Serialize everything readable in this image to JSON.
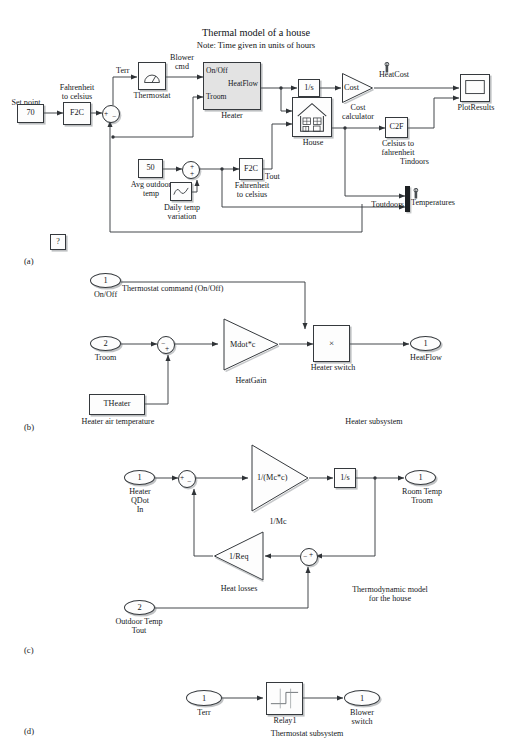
{
  "figure": {
    "title": "Thermal model of a house",
    "subtitle": "Note: Time given in units of hours",
    "panel_a": "(a)",
    "panel_b": "(b)",
    "panel_c": "(c)",
    "panel_d": "(d)"
  },
  "panel_a": {
    "caption_title": "Thermal model of a house",
    "caption_note": "Note: Time given in units of hours",
    "setpoint_label": "Set point",
    "setpoint_value": "70",
    "f2c_top_label": "Fahrenheit\nto celsius",
    "f2c_top_value": "F2C",
    "sum_plus": "+",
    "sum_minus": "−",
    "terr_label": "Terr",
    "thermostat_value": "",
    "thermostat_label": "Thermostat",
    "blower_cmd_label": "Blower\ncmd",
    "heater_port_in1": "On/Off",
    "heater_port_in2": "Troom",
    "heater_port_out": "HeatFlow",
    "heater_label": "Heater",
    "integrator_value": "1/s",
    "cost_gain_value": "Cost",
    "cost_label": "Cost\ncalculator",
    "heatcost_label": "HeatCost",
    "house_label": "House",
    "c2f_value": "C2F",
    "c2f_label": "Celsius to\nfahrenheit",
    "tindoors_label": "Tindoors",
    "toutdoors_label": "Toutdoors",
    "temperatures_label": "Temperatures",
    "plotresults_label": "PlotResults",
    "avg_outdoor_value": "50",
    "avg_outdoor_label": "Avg outdoor\ntemp",
    "daily_temp_label": "Daily temp\nvariation",
    "sum2_plus": "+",
    "sum2_plus2": "+",
    "f2c_bottom_value": "F2C",
    "f2c_bottom_label": "Fahrenheit\nto celsius",
    "tout_label": "Tout",
    "help_block_value": "?"
  },
  "panel_b": {
    "inport1_value": "1",
    "inport1_label": "On/Off",
    "annotation": "Thermostat command (On/Off)",
    "inport2_value": "2",
    "inport2_label": "Troom",
    "sum_minus": "−",
    "sum_plus": "+",
    "gain_value": "Mdot*c",
    "gain_label": "HeatGain",
    "product_value": "×",
    "product_label": "Heater switch",
    "theater_value": "THeater",
    "theater_label": "Heater air temperature",
    "outport_value": "1",
    "outport_label": "HeatFlow",
    "subsystem_label": "Heater subsystem"
  },
  "panel_c": {
    "inport1_value": "1",
    "inport1_label": "Heater\nQDot\nIn",
    "sum1_plus": "+",
    "sum1_minus": "−",
    "gain1_value": "1/(Mc*c)",
    "gain1_label": "1/Mc",
    "integrator_value": "1/s",
    "outport_value": "1",
    "outport_label": "Room Temp\nTroom",
    "gain2_value": "1/Req",
    "gain2_label": "Heat losses",
    "sum2_minus": "−",
    "sum2_plus": "+",
    "inport2_value": "2",
    "inport2_label": "Outdoor Temp\nTout",
    "subsystem_label": "Thermodynamic model\nfor the house"
  },
  "panel_d": {
    "inport_value": "1",
    "inport_label": "Terr",
    "relay_label": "Relay1",
    "outport_value": "1",
    "outport_label": "Blower\nswitch",
    "subsystem_label": "Thermostat subsystem"
  },
  "colors": {
    "line": "#35393d",
    "block_fill": "#fdfdfd",
    "block_fill_gray": "#e3e3e3",
    "shadow": "#5a5f64",
    "text": "#15181b",
    "mux": "#1d2023"
  }
}
